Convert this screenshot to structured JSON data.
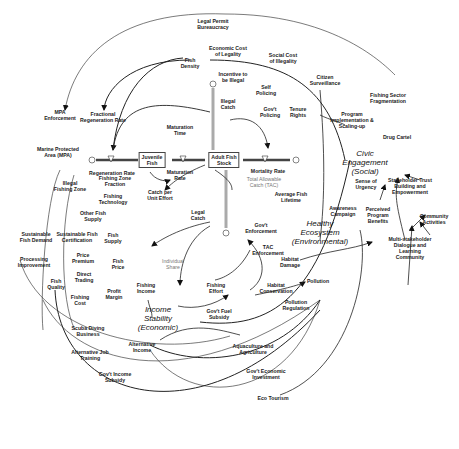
{
  "diagram": {
    "type": "causal-loop / stock-flow",
    "stocks": [
      {
        "id": "juvenile",
        "label": "Juvenile\nFish"
      },
      {
        "id": "adult",
        "label": "Adult Fish\nStock"
      }
    ],
    "flows": [
      {
        "id": "regen_rate",
        "label": "Regeneration Rate"
      },
      {
        "id": "maturation_rate",
        "label": "Maturation\nRate"
      },
      {
        "id": "mortality_rate",
        "label": "Mortality Rate"
      },
      {
        "id": "legal_catch",
        "label": "Legal\nCatch"
      },
      {
        "id": "illegal_catch",
        "label": "Illegal\nCatch"
      }
    ],
    "dimensions": [
      {
        "id": "income_stability",
        "label": "Income\nStability\n(Economic)"
      },
      {
        "id": "healthy_ecosystem",
        "label": "Healthy\nEcosystem\n(Environmental)"
      },
      {
        "id": "civic_engagement",
        "label": "Civic\nEngagement\n(Social)"
      }
    ],
    "variables": {
      "legal_permit": "Legal Permit\nBureaucracy",
      "econ_cost_legality": "Economic Cost\nof Legality",
      "fish_density": "Fish\nDensity",
      "incentive_illegal": "Incentive to\nbe Illegal",
      "social_cost_illegality": "Social Cost\nof Illegality",
      "self_policing": "Self\nPolicing",
      "citizen_surveillance": "Citizen\nSurveillance",
      "govt_policing": "Gov't\nPolicing",
      "tenure_rights": "Tenure\nRights",
      "fishing_sector_frag": "Fishing Sector\nFragmentation",
      "program_impl": "Program\nImplementation &\nScaling-up",
      "drug_cartel": "Drug Cartel",
      "mpa_enforcement": "MPA\nEnforcement",
      "fractional_regen": "Fractional\nRegeneration Rate",
      "maturation_time": "Maturation\nTime",
      "mpa": "Marine Protected\nArea (MPA)",
      "illegal_fishing_zone": "Illegal\nFishing Zone",
      "fishing_zone_fraction": "Fishing Zone\nFraction",
      "catch_per_effort": "Catch per\nUnit Effort",
      "fishing_technology": "Fishing\nTechnology",
      "tac": "Total Allowable\nCatch (TAC)",
      "avg_fish_lifetime": "Average Fish\nLifetime",
      "other_fish_supply": "Other Fish\nSupply",
      "fish_supply": "Fish\nSupply",
      "sustainable_demand": "Sustainable\nFish Demand",
      "sustainable_cert": "Sustainable Fish\nCertification",
      "price_premium": "Price\nPremium",
      "fish_price": "Fish\nPrice",
      "individual_share": "Individual\nShare",
      "processing_improvement": "Processing\nImprovement",
      "fish_quality": "Fish\nQuality",
      "direct_trading": "Direct\nTrading",
      "profit_margin": "Profit\nMargin",
      "fishing_income": "Fishing\nIncome",
      "fishing_cost": "Fishing\nCost",
      "govt_enforcement": "Gov't\nEnforcement",
      "tac_enforcement": "TAC\nEnforcement",
      "habitat_damage": "Habitat\nDamage",
      "fishing_effort": "Fishing\nEffort",
      "habitat_conservation": "Habitat\nConservation",
      "pollution": "Pollution",
      "govt_fuel_subsidy": "Gov't Fuel\nSubsidy",
      "pollution_regulation": "Pollution\nRegulation",
      "sense_urgency": "Sense of\nUrgency",
      "awareness_campaign": "Awareness\nCampaign",
      "perceived_benefits": "Perceived\nProgram\nBenefits",
      "stakeholder_trust": "Stakeholder Trust\nBuilding and\nEmpowerment",
      "community_activities": "Community\nActivities",
      "multi_stakeholder": "Multi-stakeholder\nDialogue and\nLearning\nCommunity",
      "scuba_diving": "Scuba Diving\nBusiness",
      "alt_job_training": "Alternative Job\nTraining",
      "alt_income": "Alternative\nIncome",
      "govt_income_subsidy": "Gov't Income\nSubsidy",
      "aquaculture": "Aquaculture and\nAgriculture",
      "govt_econ_investment": "Gov't Economic\nInvestment",
      "eco_tourism": "Eco Tourism"
    },
    "colors": {
      "line": "#222222",
      "thin_line": "#555555",
      "gray_text": "#777777",
      "pipe": "#9a9a9a"
    }
  }
}
